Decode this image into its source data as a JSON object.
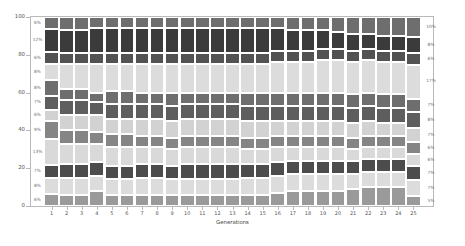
{
  "chart_data": {
    "type": "bar",
    "stacked": true,
    "title": "",
    "subtitle": "",
    "xlabel": "Generations",
    "ylabel": "",
    "xlim": [
      0.5,
      25.5
    ],
    "ylim": [
      0,
      100
    ],
    "grid": false,
    "legend": "none",
    "x_tick_labels": [
      "1",
      "2",
      "3",
      "4",
      "5",
      "6",
      "7",
      "8",
      "9",
      "10",
      "11",
      "12",
      "13",
      "14",
      "15",
      "16",
      "17",
      "18",
      "19",
      "20",
      "21",
      "22",
      "23",
      "24",
      "25"
    ],
    "y_tick_labels": [
      "0",
      "20",
      "40",
      "60",
      "80",
      "100"
    ],
    "y_tick_values": [
      0,
      20,
      40,
      60,
      80,
      100
    ],
    "categories": [
      "1",
      "2",
      "3",
      "4",
      "5",
      "6",
      "7",
      "8",
      "9",
      "10",
      "11",
      "12",
      "13",
      "14",
      "15",
      "16",
      "17",
      "18",
      "19",
      "20",
      "21",
      "22",
      "23",
      "24",
      "25"
    ],
    "left_annotations": [
      "6%",
      "12%",
      "6%",
      "8%",
      "8%",
      "7%",
      "6%",
      "9%",
      "13%",
      "7%",
      "8%",
      "6%"
    ],
    "right_annotations": [
      "10%",
      "8%",
      "6%",
      "17%",
      "7%",
      "8%",
      "7%",
      "6%",
      "6%",
      "7%",
      "7%",
      "5%"
    ],
    "series": [
      {
        "name": "clone-01",
        "color": "#6e6e6e",
        "values": [
          6,
          7,
          7,
          6,
          6,
          6,
          6,
          6,
          6,
          6,
          6,
          6,
          6,
          6,
          6,
          6,
          7,
          7,
          7,
          8,
          9,
          9,
          10,
          10,
          10
        ]
      },
      {
        "name": "clone-02",
        "color": "#3b3b3b",
        "values": [
          12,
          12,
          12,
          13,
          13,
          13,
          13,
          13,
          13,
          13,
          13,
          13,
          13,
          13,
          13,
          12,
          11,
          11,
          10,
          9,
          9,
          8,
          8,
          8,
          8
        ]
      },
      {
        "name": "clone-03",
        "color": "#525252",
        "values": [
          6,
          6,
          6,
          6,
          6,
          6,
          6,
          6,
          6,
          6,
          6,
          6,
          6,
          6,
          6,
          6,
          6,
          6,
          6,
          6,
          6,
          6,
          6,
          6,
          6
        ]
      },
      {
        "name": "clone-04",
        "color": "#dcdcdc",
        "values": [
          8,
          13,
          13,
          15,
          14,
          14,
          15,
          15,
          15,
          15,
          15,
          15,
          15,
          15,
          15,
          16,
          16,
          16,
          17,
          17,
          17,
          17,
          17,
          17,
          17
        ]
      },
      {
        "name": "clone-05",
        "color": "#6e6e6e",
        "values": [
          8,
          6,
          6,
          5,
          7,
          7,
          6,
          6,
          7,
          6,
          6,
          6,
          6,
          7,
          7,
          7,
          7,
          7,
          7,
          7,
          7,
          7,
          7,
          7,
          7
        ]
      },
      {
        "name": "clone-06",
        "color": "#5e5e5e",
        "values": [
          7,
          8,
          8,
          7,
          8,
          8,
          8,
          8,
          8,
          8,
          8,
          8,
          8,
          8,
          8,
          8,
          8,
          8,
          8,
          8,
          8,
          8,
          8,
          8,
          8
        ]
      },
      {
        "name": "clone-07",
        "color": "#d2d2d2",
        "values": [
          6,
          8,
          8,
          9,
          8,
          8,
          9,
          9,
          9,
          9,
          9,
          9,
          9,
          9,
          9,
          8,
          8,
          8,
          8,
          8,
          8,
          8,
          7,
          7,
          7
        ]
      },
      {
        "name": "clone-08",
        "color": "#858585",
        "values": [
          9,
          7,
          7,
          6,
          7,
          7,
          6,
          6,
          6,
          6,
          6,
          6,
          6,
          6,
          6,
          6,
          6,
          6,
          6,
          6,
          6,
          6,
          6,
          6,
          6
        ]
      },
      {
        "name": "clone-09",
        "color": "#d9d9d9",
        "values": [
          13,
          11,
          11,
          10,
          10,
          10,
          9,
          9,
          9,
          9,
          9,
          9,
          9,
          8,
          8,
          8,
          7,
          7,
          7,
          7,
          6,
          6,
          6,
          6,
          6
        ]
      },
      {
        "name": "clone-10",
        "color": "#4c4c4c",
        "values": [
          7,
          7,
          7,
          7,
          7,
          7,
          7,
          7,
          7,
          8,
          8,
          8,
          8,
          7,
          7,
          7,
          7,
          7,
          7,
          7,
          7,
          7,
          7,
          7,
          7
        ]
      },
      {
        "name": "clone-11",
        "color": "#dcdcdc",
        "values": [
          8,
          9,
          9,
          8,
          8,
          8,
          9,
          9,
          8,
          8,
          8,
          8,
          8,
          9,
          9,
          9,
          9,
          9,
          9,
          9,
          8,
          8,
          8,
          8,
          8
        ]
      },
      {
        "name": "clone-12",
        "color": "#9a9a9a",
        "values": [
          6,
          6,
          6,
          8,
          6,
          6,
          6,
          6,
          6,
          6,
          6,
          6,
          6,
          6,
          6,
          7,
          8,
          8,
          8,
          8,
          9,
          10,
          10,
          10,
          5
        ]
      }
    ]
  },
  "axes": {
    "x_label": "Generations"
  }
}
